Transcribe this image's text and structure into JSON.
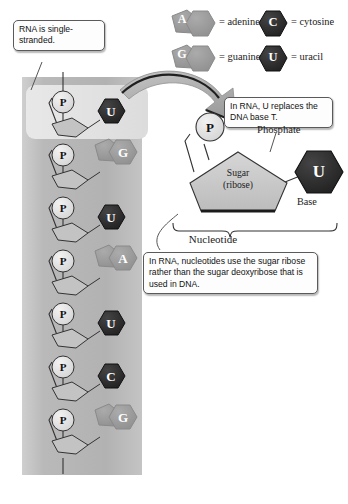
{
  "figure": {
    "colors": {
      "strand_panel": "#b6b6b6",
      "highlight_panel": "#dedede",
      "pyrimidine_fill": "#262626",
      "purine_fill": "#9a9a9a",
      "sugar_fill": "#c9c9c9",
      "phosphate_fill": "#dcdcdc",
      "detail_base_fill": "#3a3a3a",
      "arrow_fill": "#b0b0b0",
      "callout_bg": "#fdfdfd",
      "outline": "#3a3a3a"
    }
  },
  "legend": {
    "items": [
      {
        "symbol": "A",
        "shape": "purine",
        "equals": "=",
        "label": "adenine"
      },
      {
        "symbol": "C",
        "shape": "pyrimidine",
        "equals": "=",
        "label": "cytosine"
      },
      {
        "symbol": "G",
        "shape": "purine",
        "equals": "=",
        "label": "guanine"
      },
      {
        "symbol": "U",
        "shape": "pyrimidine",
        "equals": "=",
        "label": "uracil"
      }
    ]
  },
  "callouts": {
    "single_stranded": "RNA is single-stranded.",
    "u_replaces_t": "In RNA, U replaces the DNA base T.",
    "ribose_note": "In RNA, nucleotides use the sugar ribose rather than the sugar deoxyribose that is used in DNA."
  },
  "strand": {
    "phosphate_symbol": "P",
    "nucleotides": [
      {
        "base": "U",
        "shape": "pyrimidine",
        "highlighted": true
      },
      {
        "base": "G",
        "shape": "purine",
        "highlighted": false
      },
      {
        "base": "U",
        "shape": "pyrimidine",
        "highlighted": false
      },
      {
        "base": "A",
        "shape": "purine",
        "highlighted": false
      },
      {
        "base": "U",
        "shape": "pyrimidine",
        "highlighted": false
      },
      {
        "base": "C",
        "shape": "pyrimidine",
        "highlighted": false
      },
      {
        "base": "G",
        "shape": "purine",
        "highlighted": false
      }
    ]
  },
  "detail": {
    "phosphate_symbol": "P",
    "phosphate_label": "Phosphate",
    "sugar_line1": "Sugar",
    "sugar_line2": "(ribose)",
    "base_symbol": "U",
    "base_label": "Base",
    "bracket_label": "Nucleotide"
  }
}
